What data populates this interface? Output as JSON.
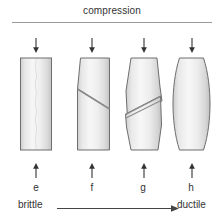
{
  "figure": {
    "title": "compression",
    "scale": {
      "left_label": "brittle",
      "right_label": "ductile",
      "arrow_icon": "right-arrow-icon"
    },
    "specimens": [
      {
        "letter": "e",
        "shape": "straight-prism",
        "failure": "axial-splitting",
        "top_arrow_icon": "down-arrow-icon",
        "bottom_arrow_icon": "up-arrow-icon"
      },
      {
        "letter": "f",
        "shape": "straight-prism",
        "failure": "single-shear-plane",
        "top_arrow_icon": "down-arrow-icon",
        "bottom_arrow_icon": "up-arrow-icon"
      },
      {
        "letter": "g",
        "shape": "barrelled",
        "failure": "shear-band",
        "top_arrow_icon": "down-arrow-icon",
        "bottom_arrow_icon": "up-arrow-icon"
      },
      {
        "letter": "h",
        "shape": "barrelled",
        "failure": "none-bulging",
        "top_arrow_icon": "down-arrow-icon",
        "bottom_arrow_icon": "up-arrow-icon"
      }
    ]
  },
  "colors": {
    "specimen_light": "#f2f2f2",
    "specimen_mid": "#e3e3e3",
    "specimen_dark": "#c9c9c9",
    "outline": "#6e6e6e",
    "crack": "#8c8c8c",
    "rule": "#9a9a9a",
    "text": "#333333",
    "background": "#ffffff"
  }
}
